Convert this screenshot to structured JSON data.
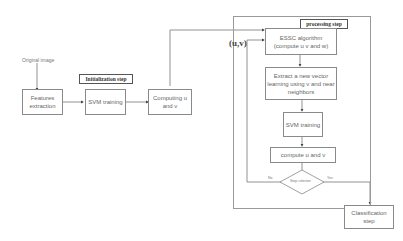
{
  "diagram": {
    "input_label": "Original image",
    "initialization": {
      "title": "Initialization step",
      "boxes": [
        {
          "label": "Features extraction"
        },
        {
          "label": "SVM training"
        },
        {
          "label": "Computing u and v"
        }
      ]
    },
    "processing": {
      "title": "processing step",
      "feedback_label": "(u,v)",
      "boxes": [
        {
          "label": "ESSC algorithm (compute u v and w)"
        },
        {
          "label": "Extract a new vector learning using v and near neighbors"
        },
        {
          "label": "SVM training"
        },
        {
          "label": "compute u and v"
        }
      ],
      "decision": {
        "label": "Stop criterion",
        "no_label": "No",
        "yes_label": "Yes"
      }
    },
    "output": {
      "label": "Classification step"
    },
    "colors": {
      "line": "#666666",
      "border": "#8a8a8a"
    }
  }
}
